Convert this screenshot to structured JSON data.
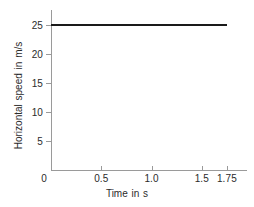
{
  "chart_data": {
    "type": "line",
    "title": "",
    "xlabel": "Time in s",
    "ylabel": "Horizontal speed  in m/s",
    "xlim": [
      0,
      1.95
    ],
    "ylim": [
      0,
      27.5
    ],
    "grid": false,
    "legend": "none",
    "x_ticks": [
      {
        "value": 0,
        "label": "0"
      },
      {
        "value": 0.5,
        "label": "0.5"
      },
      {
        "value": 1.0,
        "label": "1.0"
      },
      {
        "value": 1.5,
        "label": "1.5"
      },
      {
        "value": 1.75,
        "label": "1.75"
      }
    ],
    "y_ticks": [
      {
        "value": 5,
        "label": "5"
      },
      {
        "value": 10,
        "label": "10"
      },
      {
        "value": 15,
        "label": "15"
      },
      {
        "value": 20,
        "label": "20"
      },
      {
        "value": 25,
        "label": "25"
      }
    ],
    "series": [
      {
        "name": "Horizontal speed",
        "color": "#1a1a1a",
        "x": [
          0,
          1.75
        ],
        "values": [
          25,
          25
        ]
      }
    ],
    "colors": {
      "axis": "#9a9a9a",
      "line": "#1a1a1a",
      "text": "#2b2b2b",
      "background": "#ffffff"
    }
  }
}
